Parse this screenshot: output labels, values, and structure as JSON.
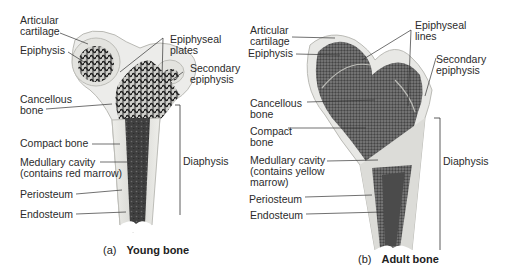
{
  "figure": {
    "panels": [
      {
        "id": "a",
        "letter": "(a)",
        "title": "Young bone",
        "labels": {
          "articular_cartilage_1": "Articular",
          "articular_cartilage_2": "cartilage",
          "epiphysis": "Epiphysis",
          "epiphyseal_1": "Epiphyseal",
          "epiphyseal_2": "plates",
          "secondary_1": "Secondary",
          "secondary_2": "epiphysis",
          "cancellous_1": "Cancellous",
          "cancellous_2": "bone",
          "compact": "Compact bone",
          "medullary_1": "Medullary cavity",
          "medullary_2": "(contains red marrow)",
          "periosteum": "Periosteum",
          "endosteum": "Endosteum",
          "diaphysis": "Diaphysis"
        }
      },
      {
        "id": "b",
        "letter": "(b)",
        "title": "Adult bone",
        "labels": {
          "articular_cartilage_1": "Articular",
          "articular_cartilage_2": "cartilage",
          "epiphysis": "Epiphysis",
          "epiphyseal_1": "Epiphyseal",
          "epiphyseal_2": "lines",
          "secondary_1": "Secondary",
          "secondary_2": "epiphysis",
          "cancellous_1": "Cancellous",
          "cancellous_2": "bone",
          "compact_1": "Compact",
          "compact_2": "bone",
          "medullary_1": "Medullary cavity",
          "medullary_2": "(contains yellow",
          "medullary_3": "marrow)",
          "periosteum": "Periosteum",
          "endosteum": "Endosteum",
          "diaphysis": "Diaphysis"
        }
      }
    ],
    "colors": {
      "cartilage": "#e6e6e2",
      "compact": "#d9d9d6",
      "cancellous_young": "#2e2e2e",
      "cancellous_adult": "#5a5a5a",
      "marrow": "#4a4a4a",
      "leader": "#333333"
    }
  }
}
